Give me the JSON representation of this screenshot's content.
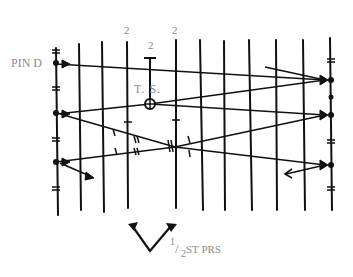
{
  "diagram": {
    "type": "hand-drawn pattern diagram",
    "labels": {
      "pin": "PIN D",
      "ts": "T. S.",
      "top_numbers": [
        "2",
        "2",
        "2"
      ],
      "fraction_numerator": "1",
      "fraction_slash": "/",
      "fraction_denominator": "2",
      "stitch_label": "ST PRS"
    },
    "colors": {
      "line": "#111111",
      "label": "#8a8a8a",
      "background": "#ffffff"
    },
    "vertical_lines_x": [
      55,
      79,
      103,
      128,
      176,
      200,
      224,
      250,
      277,
      305,
      330
    ],
    "rows_left_y": [
      63,
      113,
      162
    ],
    "rows_right_y": [
      79,
      114,
      165
    ],
    "ts_marker": {
      "x": 150,
      "y": 104
    }
  }
}
